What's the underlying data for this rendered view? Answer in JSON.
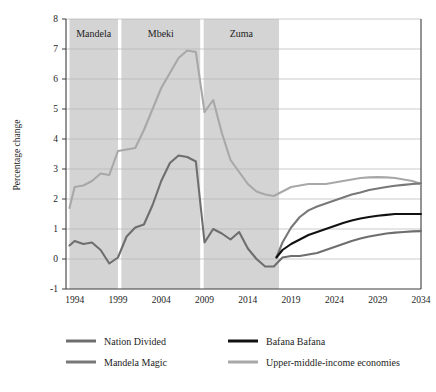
{
  "chart_data": {
    "type": "line",
    "title": "",
    "subtitle": "",
    "xlabel": "",
    "ylabel": "Percentage change",
    "xlim": [
      1993,
      2034
    ],
    "ylim": [
      -1,
      8
    ],
    "ytick_labels": [
      "8",
      "7",
      "6",
      "5",
      "4",
      "3",
      "2",
      "1",
      "0",
      "-1"
    ],
    "ytick_values": [
      8,
      7,
      6,
      5,
      4,
      3,
      2,
      1,
      0,
      -1
    ],
    "xtick_labels": [
      "1994",
      "1999",
      "2004",
      "2009",
      "2014",
      "2019",
      "2024",
      "2029",
      "2034"
    ],
    "xtick_values": [
      1994,
      1999,
      2004,
      2009,
      2014,
      2019,
      2024,
      2029,
      2034
    ],
    "grid": true,
    "grid_axis": "y",
    "legend_position": "bottom",
    "shaded_regions": [
      {
        "label": "Mandela",
        "start": 1993.4,
        "end": 1999.0
      },
      {
        "label": "Mbeki",
        "start": 1999.4,
        "end": 2008.5
      },
      {
        "label": "Zuma",
        "start": 2008.9,
        "end": 2017.6
      }
    ],
    "series": [
      {
        "name": "Upper-middle-income economies",
        "color": "#a8a8a8",
        "x": [
          1993.4,
          1994,
          1995,
          1996,
          1997,
          1998,
          1999,
          2000,
          2001,
          2002,
          2003,
          2004,
          2005,
          2006,
          2007,
          2008,
          2009,
          2010,
          2011,
          2012,
          2013,
          2014,
          2015,
          2016,
          2017,
          2018,
          2019,
          2020,
          2021,
          2022,
          2023,
          2024,
          2025,
          2026,
          2027,
          2028,
          2029,
          2030,
          2031,
          2032,
          2033,
          2034
        ],
        "values": [
          1.7,
          2.4,
          2.45,
          2.6,
          2.85,
          2.8,
          3.6,
          3.65,
          3.7,
          4.3,
          5.0,
          5.7,
          6.2,
          6.7,
          6.95,
          6.9,
          4.9,
          5.3,
          4.2,
          3.3,
          2.9,
          2.5,
          2.25,
          2.15,
          2.1,
          2.25,
          2.4,
          2.45,
          2.5,
          2.5,
          2.5,
          2.55,
          2.6,
          2.65,
          2.7,
          2.72,
          2.73,
          2.72,
          2.7,
          2.65,
          2.6,
          2.5
        ]
      },
      {
        "name": "Nation Divided",
        "color": "#6e6e6e",
        "x": [
          1993.4,
          1994,
          1995,
          1996,
          1997,
          1998,
          1999,
          2000,
          2001,
          2002,
          2003,
          2004,
          2005,
          2006,
          2007,
          2008,
          2009,
          2010,
          2011,
          2012,
          2013,
          2014,
          2015,
          2016,
          2017,
          2018,
          2019,
          2020,
          2021,
          2022,
          2023,
          2024,
          2025,
          2026,
          2027,
          2028,
          2029,
          2030,
          2031,
          2032,
          2033,
          2034
        ],
        "values": [
          0.45,
          0.6,
          0.5,
          0.55,
          0.3,
          -0.15,
          0.05,
          0.75,
          1.05,
          1.15,
          1.8,
          2.6,
          3.2,
          3.45,
          3.4,
          3.25,
          0.55,
          1.0,
          0.85,
          0.65,
          0.9,
          0.35,
          0.0,
          -0.25,
          -0.25,
          0.05,
          0.1,
          0.1,
          0.15,
          0.2,
          0.3,
          0.4,
          0.5,
          0.6,
          0.68,
          0.75,
          0.8,
          0.85,
          0.88,
          0.9,
          0.92,
          0.93
        ]
      },
      {
        "name": "Mandela Magic",
        "color": "#787878",
        "x": [
          2017.3,
          2018,
          2019,
          2020,
          2021,
          2022,
          2023,
          2024,
          2025,
          2026,
          2027,
          2028,
          2029,
          2030,
          2031,
          2032,
          2033,
          2034
        ],
        "values": [
          0.05,
          0.55,
          1.05,
          1.4,
          1.62,
          1.75,
          1.85,
          1.95,
          2.05,
          2.15,
          2.22,
          2.3,
          2.35,
          2.4,
          2.44,
          2.47,
          2.5,
          2.52
        ]
      },
      {
        "name": "Bafana Bafana",
        "color": "#111111",
        "x": [
          2017.3,
          2018,
          2019,
          2020,
          2021,
          2022,
          2023,
          2024,
          2025,
          2026,
          2027,
          2028,
          2029,
          2030,
          2031,
          2032,
          2033,
          2034
        ],
        "values": [
          0.05,
          0.3,
          0.5,
          0.65,
          0.8,
          0.9,
          1.0,
          1.1,
          1.2,
          1.28,
          1.35,
          1.4,
          1.44,
          1.47,
          1.5,
          1.5,
          1.5,
          1.5
        ]
      }
    ],
    "legend": [
      {
        "name": "Nation Divided",
        "color": "#6e6e6e"
      },
      {
        "name": "Bafana Bafana",
        "color": "#111111"
      },
      {
        "name": "Mandela Magic",
        "color": "#787878"
      },
      {
        "name": "Upper-middle-income economies",
        "color": "#a8a8a8"
      }
    ],
    "colors": {
      "shaded_band": "#d4d4d4",
      "gridline": "#b5b5b5",
      "axis": "#3c3c3c",
      "background": "#ffffff"
    }
  }
}
